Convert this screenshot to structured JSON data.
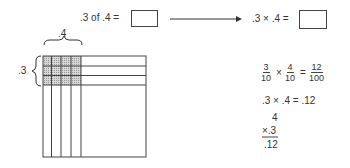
{
  "top_equation": {
    "left": ".3  of  .4 =",
    "right": ".3 × .4 ="
  },
  "grid": {
    "label_top": ".4",
    "label_left": ".3",
    "columns_shaded": 4,
    "rows_shaded": 3,
    "shade_color": "#c8c8c8",
    "line_color": "#444444"
  },
  "work": {
    "fraction1": {
      "num": "3",
      "den": "10"
    },
    "times": "×",
    "fraction2": {
      "num": "4",
      "den": "10"
    },
    "equals": "=",
    "fraction3": {
      "num": "12",
      "den": "100"
    },
    "decimal_line": ".3 × .4 = .12",
    "vertical": {
      "top": "4",
      "multiplier": "×.3",
      "result": ".12"
    }
  }
}
